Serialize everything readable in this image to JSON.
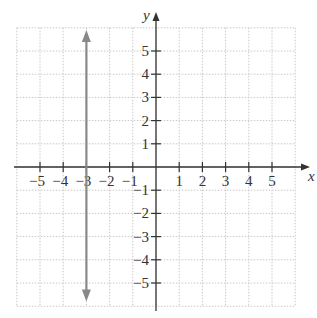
{
  "chart_data": {
    "type": "line",
    "title": "",
    "xlabel": "x",
    "ylabel": "y",
    "xlim": [
      -6,
      6
    ],
    "ylim": [
      -6,
      6
    ],
    "grid": true,
    "x_ticks": [
      -5,
      -4,
      -3,
      -2,
      -1,
      1,
      2,
      3,
      4,
      5
    ],
    "y_ticks": [
      5,
      4,
      3,
      2,
      1,
      -1,
      -2,
      -3,
      -4,
      -5
    ],
    "x_tick_labels": [
      "−5",
      "−4",
      "−3",
      "−2",
      "−1",
      "1",
      "2",
      "3",
      "4",
      "5"
    ],
    "y_tick_labels": [
      "5",
      "4",
      "3",
      "2",
      "1",
      "−1",
      "−2",
      "−3",
      "−4",
      "−5"
    ],
    "series": [
      {
        "name": "x = -3",
        "description": "vertical line with arrows at both ends",
        "x": [
          -3,
          -3
        ],
        "y": [
          5.9,
          -5.8
        ],
        "color": "#888888"
      }
    ],
    "legend": null
  },
  "colors": {
    "axis": "#333333",
    "grid": "#c8c8c8",
    "line": "#888888"
  }
}
